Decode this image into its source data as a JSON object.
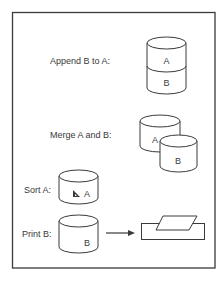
{
  "diagram": {
    "type": "database-operations-illustration",
    "operations": [
      {
        "id": "append",
        "label": "Append B to A:",
        "icon": "stacked-cylinder-icon",
        "segments": [
          "A",
          "B"
        ]
      },
      {
        "id": "merge",
        "label": "Merge A and B:",
        "icon": "overlapping-cylinders-icon",
        "cylinders": [
          "A",
          "B"
        ]
      },
      {
        "id": "sort",
        "label": "Sort A:",
        "icon": "cylinder-with-sort-triangle-icon",
        "cylinder": "A",
        "symbol": "triangle-icon"
      },
      {
        "id": "print",
        "label": "Print B:",
        "icon": "cylinder-icon",
        "cylinder": "B",
        "arrow": "arrow-right-icon",
        "target": "printer-icon"
      }
    ],
    "colors": {
      "stroke": "#3a3a3a",
      "text": "#3a3a3a",
      "background": "#ffffff"
    }
  }
}
